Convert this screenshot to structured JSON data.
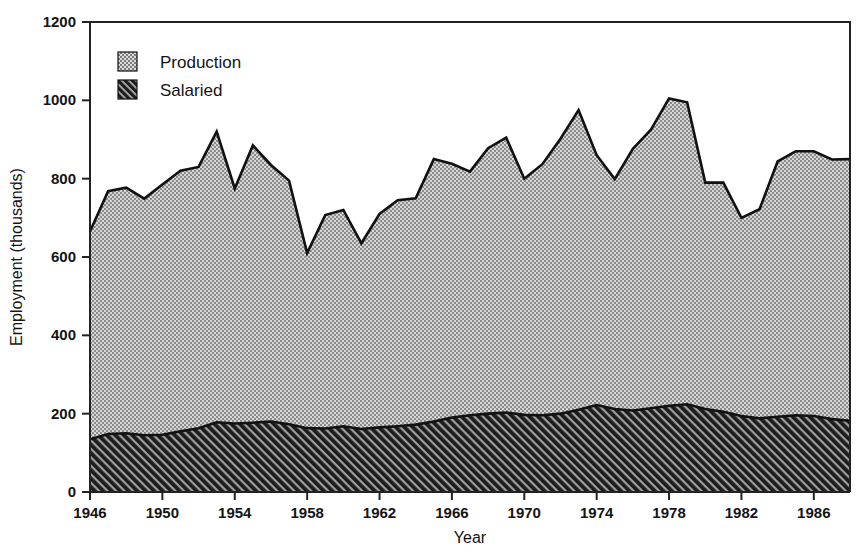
{
  "chart_data": {
    "type": "area",
    "title": "",
    "subtitle": "",
    "xlabel": "Year",
    "ylabel": "Employment (thousands)",
    "stacked": true,
    "grid": false,
    "legend_position": "top-left-inside",
    "xlim": [
      1946,
      1988
    ],
    "ylim": [
      0,
      1200
    ],
    "x_ticks": [
      1946,
      1950,
      1954,
      1958,
      1962,
      1966,
      1970,
      1974,
      1978,
      1982,
      1986
    ],
    "x_tick_labels": [
      "1946",
      "1950",
      "1954",
      "1958",
      "1962",
      "1966",
      "1970",
      "1974",
      "1978",
      "1982",
      "1986"
    ],
    "y_ticks": [
      0,
      200,
      400,
      600,
      800,
      1000,
      1200
    ],
    "y_tick_labels": [
      "0",
      "200",
      "400",
      "600",
      "800",
      "1000",
      "1200"
    ],
    "x": [
      1946,
      1947,
      1948,
      1949,
      1950,
      1951,
      1952,
      1953,
      1954,
      1955,
      1956,
      1957,
      1958,
      1959,
      1960,
      1961,
      1962,
      1963,
      1964,
      1965,
      1966,
      1967,
      1968,
      1969,
      1970,
      1971,
      1972,
      1973,
      1974,
      1975,
      1976,
      1977,
      1978,
      1979,
      1980,
      1981,
      1982,
      1983,
      1984,
      1985,
      1986,
      1987,
      1988
    ],
    "series": [
      {
        "name": "Salaried",
        "fill_pattern": "diagonal-hatch-dark",
        "fill_color": "#333333",
        "values": [
          135,
          148,
          150,
          145,
          146,
          155,
          163,
          178,
          175,
          177,
          180,
          173,
          163,
          162,
          168,
          161,
          165,
          168,
          172,
          180,
          190,
          196,
          200,
          203,
          197,
          196,
          200,
          210,
          222,
          212,
          208,
          214,
          220,
          224,
          212,
          205,
          194,
          188,
          192,
          196,
          194,
          186,
          182
        ]
      },
      {
        "name": "Production",
        "fill_pattern": "dotted-light",
        "fill_color": "#b3b3b3",
        "values": [
          530,
          620,
          627,
          604,
          639,
          665,
          667,
          742,
          600,
          708,
          655,
          622,
          447,
          545,
          552,
          474,
          545,
          577,
          578,
          670,
          648,
          622,
          678,
          702,
          603,
          641,
          702,
          765,
          638,
          587,
          668,
          711,
          785,
          771,
          578,
          585,
          506,
          534,
          652,
          674,
          676,
          663,
          668
        ]
      }
    ],
    "totals": [
      665,
      768,
      777,
      749,
      785,
      820,
      830,
      920,
      775,
      885,
      835,
      795,
      610,
      707,
      720,
      635,
      710,
      745,
      750,
      850,
      838,
      818,
      878,
      905,
      800,
      837,
      902,
      975,
      860,
      799,
      876,
      925,
      1005,
      995,
      790,
      790,
      700,
      722,
      844,
      870,
      870,
      849,
      850
    ]
  },
  "legend": {
    "items": [
      {
        "label": "Production",
        "swatch": "light-dotted-swatch"
      },
      {
        "label": "Salaried",
        "swatch": "dark-hatched-swatch"
      }
    ]
  },
  "colors": {
    "production_fill": "#b3b3b3",
    "salaried_fill": "#333333",
    "outline": "#111111",
    "axis": "#222222",
    "background": "#ffffff"
  }
}
